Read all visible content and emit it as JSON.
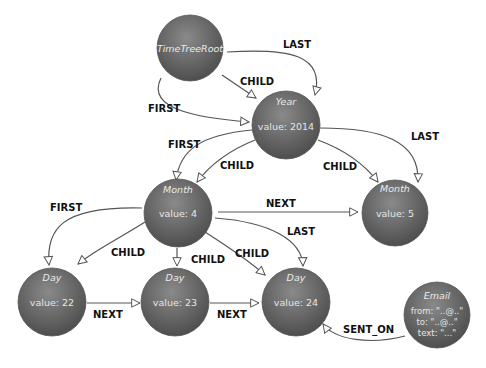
{
  "diagram": {
    "node_fill": "#7a7a7a",
    "node_fill_dark": "#4e4e4e",
    "edge_color": "#555555",
    "nodes": [
      {
        "id": "root",
        "type": "TimeTreeRoot",
        "lines": []
      },
      {
        "id": "year",
        "type": "Year",
        "lines": [
          "value: 2014"
        ]
      },
      {
        "id": "month4",
        "type": "Month",
        "lines": [
          "value: 4"
        ]
      },
      {
        "id": "month5",
        "type": "Month",
        "lines": [
          "value: 5"
        ]
      },
      {
        "id": "day22",
        "type": "Day",
        "lines": [
          "value: 22"
        ]
      },
      {
        "id": "day23",
        "type": "Day",
        "lines": [
          "value: 23"
        ]
      },
      {
        "id": "day24",
        "type": "Day",
        "lines": [
          "value: 24"
        ]
      },
      {
        "id": "email",
        "type": "Email",
        "lines": [
          "from: \"..@..\"",
          "to: \"..@..\"",
          "text: \"...\""
        ]
      }
    ],
    "edges": [
      {
        "from": "root",
        "to": "year",
        "label": "LAST"
      },
      {
        "from": "root",
        "to": "year",
        "label": "CHILD"
      },
      {
        "from": "root",
        "to": "year",
        "label": "FIRST"
      },
      {
        "from": "year",
        "to": "month4",
        "label": "FIRST"
      },
      {
        "from": "year",
        "to": "month4",
        "label": "CHILD"
      },
      {
        "from": "year",
        "to": "month5",
        "label": "CHILD"
      },
      {
        "from": "year",
        "to": "month5",
        "label": "LAST"
      },
      {
        "from": "month4",
        "to": "month5",
        "label": "NEXT"
      },
      {
        "from": "month4",
        "to": "day22",
        "label": "FIRST"
      },
      {
        "from": "month4",
        "to": "day22",
        "label": "CHILD"
      },
      {
        "from": "month4",
        "to": "day23",
        "label": "CHILD"
      },
      {
        "from": "month4",
        "to": "day24",
        "label": "CHILD"
      },
      {
        "from": "month4",
        "to": "day24",
        "label": "LAST"
      },
      {
        "from": "day22",
        "to": "day23",
        "label": "NEXT"
      },
      {
        "from": "day23",
        "to": "day24",
        "label": "NEXT"
      },
      {
        "from": "email",
        "to": "day24",
        "label": "SENT_ON"
      }
    ]
  }
}
